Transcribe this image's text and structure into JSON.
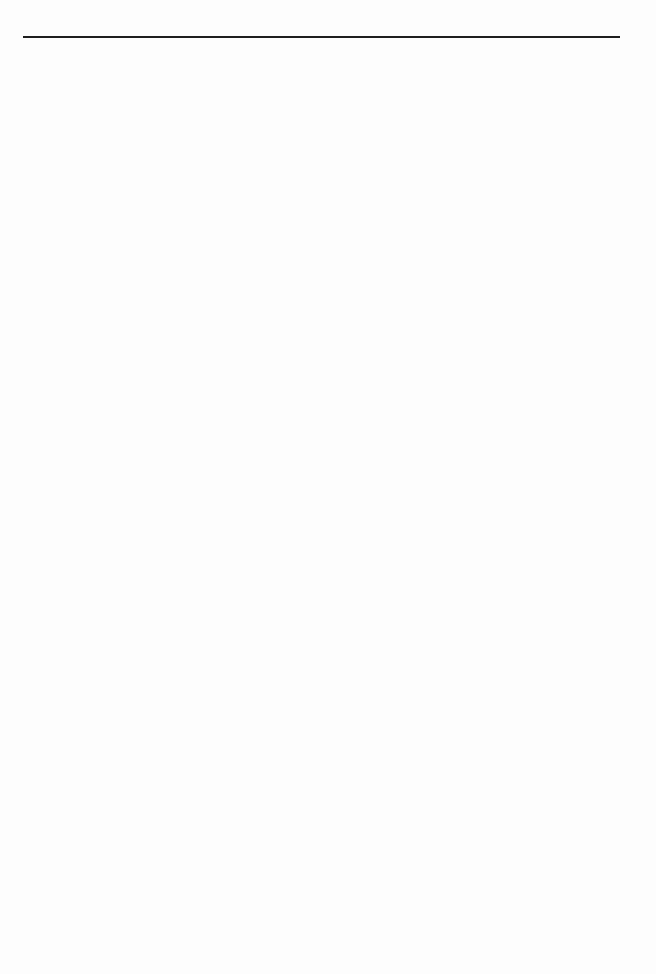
{
  "page": {
    "type": "lined-paper",
    "background_color": "#fdfdfd",
    "header_rule": {
      "y": 36,
      "thickness": 2,
      "color": "#1e1e1e"
    },
    "rules": {
      "first_y": 86,
      "spacing": 28,
      "count": 32,
      "left": 23,
      "right": 620,
      "color": "#7a7a7a"
    },
    "marks": [
      {
        "x": 322,
        "y": 725,
        "size": 5,
        "color": "#333333"
      },
      {
        "x": 300,
        "y": 82,
        "size": 1.5,
        "color": "#999999"
      },
      {
        "x": 650,
        "y": 594,
        "size": 1.5,
        "color": "#aaaaaa"
      }
    ]
  }
}
